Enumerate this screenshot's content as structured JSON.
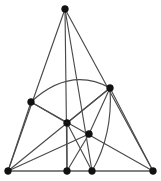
{
  "figure": {
    "type": "line-diagram",
    "width": 161,
    "height": 181,
    "background_color": "#ffffff",
    "line_color": "#4a4a4a",
    "base_line_color": "#5a5a5a",
    "vertex_color": "#111111",
    "vertex_radius": 3.4,
    "line_width": 1.15,
    "base_line_width": 1.5
  },
  "vertices": [
    {
      "id": "apex",
      "name": "apex-vertex",
      "x": 65,
      "y": 9,
      "label": ""
    },
    {
      "id": "left_mid",
      "name": "left-middle-vertex",
      "x": 31,
      "y": 102,
      "label": ""
    },
    {
      "id": "right_mid",
      "name": "right-middle-vertex",
      "x": 110,
      "y": 88,
      "label": ""
    },
    {
      "id": "center",
      "name": "center-vertex",
      "x": 67,
      "y": 123,
      "label": ""
    },
    {
      "id": "lower_center",
      "name": "lower-center-vertex",
      "x": 89,
      "y": 134,
      "label": ""
    },
    {
      "id": "base_left",
      "name": "base-left-vertex",
      "x": 8,
      "y": 171,
      "label": ""
    },
    {
      "id": "base_mid_left",
      "name": "base-middle-left-vertex",
      "x": 67,
      "y": 171,
      "label": ""
    },
    {
      "id": "base_mid_right",
      "name": "base-middle-right-vertex",
      "x": 92,
      "y": 171,
      "label": ""
    },
    {
      "id": "base_right",
      "name": "base-right-vertex",
      "x": 153,
      "y": 171,
      "label": ""
    }
  ],
  "edges": [
    {
      "id": "e1",
      "name": "edge-apex-to-base-left",
      "from": "apex",
      "to": "base_left",
      "kind": "straight"
    },
    {
      "id": "e2",
      "name": "edge-apex-to-base-middle-left",
      "from": "apex",
      "to": "base_mid_left",
      "kind": "straight"
    },
    {
      "id": "e3",
      "name": "edge-apex-to-base-middle-right",
      "from": "apex",
      "to": "base_mid_right",
      "kind": "straight"
    },
    {
      "id": "e4",
      "name": "edge-apex-to-base-right",
      "from": "apex",
      "to": "base_right",
      "kind": "straight"
    },
    {
      "id": "e5",
      "name": "edge-base-left-to-left-middle",
      "from": "base_left",
      "to": "left_mid",
      "kind": "straight"
    },
    {
      "id": "e6",
      "name": "edge-base-left-to-right-middle",
      "from": "base_left",
      "to": "right_mid",
      "kind": "straight"
    },
    {
      "id": "e7",
      "name": "edge-base-left-to-lower-center",
      "from": "base_left",
      "to": "lower_center",
      "kind": "straight"
    },
    {
      "id": "e8",
      "name": "edge-left-middle-to-center",
      "from": "left_mid",
      "to": "center",
      "kind": "straight"
    },
    {
      "id": "e9",
      "name": "edge-left-middle-to-base-right",
      "from": "left_mid",
      "to": "base_right",
      "kind": "straight"
    },
    {
      "id": "e10",
      "name": "edge-center-to-right-middle",
      "from": "center",
      "to": "right_mid",
      "kind": "straight"
    },
    {
      "id": "e11",
      "name": "edge-center-to-base-middle-right",
      "from": "center",
      "to": "base_mid_right",
      "kind": "straight"
    },
    {
      "id": "e12",
      "name": "edge-right-middle-to-lower-center",
      "from": "right_mid",
      "to": "lower_center",
      "kind": "straight"
    },
    {
      "id": "e13",
      "name": "edge-right-middle-to-base-right",
      "from": "right_mid",
      "to": "base_right",
      "kind": "straight"
    },
    {
      "id": "e14",
      "name": "edge-lower-center-to-base-mid-left",
      "from": "lower_center",
      "to": "base_mid_left",
      "kind": "straight"
    },
    {
      "id": "e15",
      "name": "edge-center-to-base-middle-left",
      "from": "center",
      "to": "base_mid_left",
      "kind": "straight"
    }
  ],
  "base": {
    "name": "base-line",
    "from": "base_left",
    "to": "base_right",
    "y": 171
  },
  "arcs": [
    {
      "id": "a1",
      "name": "arc-left-middle-to-right-middle",
      "from": "left_mid",
      "to": "right_mid",
      "control_x": 70,
      "control_y": 66,
      "description": "upward bowing arc over the interior"
    },
    {
      "id": "a2",
      "name": "arc-right-middle-to-base-middle-right",
      "from": "right_mid",
      "to": "base_mid_right",
      "control_x": 113,
      "control_y": 135,
      "description": "rightward bowing arc descending to base"
    }
  ]
}
